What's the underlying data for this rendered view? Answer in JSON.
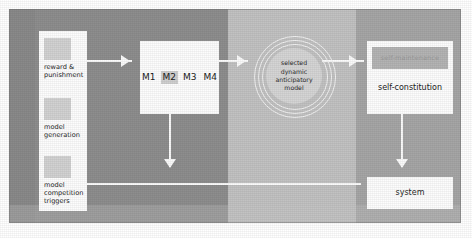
{
  "diagram": {
    "colors": {
      "panel_background": "#8e8e8e",
      "band_left": "#8a8a8a",
      "band_middle": "#8e8e8e",
      "band_light": "#c2c2c2",
      "band_right": "#a6a6a6",
      "node_fill": "#fdfdfd",
      "connector": "#fbfbfb",
      "circle_core": "#d5d5d5",
      "selected_model_highlight": "#cfcfcf",
      "thumbnail_fill": "#d2d2d2"
    }
  },
  "left_stack": {
    "items": [
      {
        "label": "reward &\npunishment",
        "thumb": "placeholder-thumbnail"
      },
      {
        "label": "model\ngeneration",
        "thumb": "placeholder-thumbnail"
      },
      {
        "label": "model\ncompetition\ntriggers",
        "thumb": "placeholder-thumbnail"
      }
    ]
  },
  "models_box": {
    "models": [
      {
        "label": "M1",
        "selected": false
      },
      {
        "label": "M2",
        "selected": true
      },
      {
        "label": "M3",
        "selected": false
      },
      {
        "label": "M4",
        "selected": false
      }
    ]
  },
  "circles": {
    "label": "selected\ndynamic\nanticipatory\nmodel",
    "ring_count": 3
  },
  "self_constitution": {
    "faded_label": "self-maintenance",
    "label": "self-constitution"
  },
  "system": {
    "label": "system"
  },
  "connectors": [
    {
      "name": "reward-to-models",
      "direction": "right"
    },
    {
      "name": "models-to-circle",
      "direction": "right"
    },
    {
      "name": "circle-to-self-constitution",
      "direction": "right"
    },
    {
      "name": "models-down-to-feedback",
      "direction": "down"
    },
    {
      "name": "self-constitution-down-to-system",
      "direction": "down"
    },
    {
      "name": "system-to-model-competition-triggers",
      "direction": "left"
    }
  ]
}
